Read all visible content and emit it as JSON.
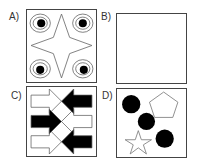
{
  "panels": [
    {
      "id": "A",
      "label": "A)",
      "content": "four concentric circle pairs with black dots in corners, central four-pointed star outline"
    },
    {
      "id": "B",
      "label": "B)",
      "content": "empty"
    },
    {
      "id": "C",
      "label": "C)",
      "content": "interleaved arrows: white right arrows and black left arrows"
    },
    {
      "id": "D",
      "label": "D)",
      "content": "three black circles on diagonal, pentagon outline, star outline"
    }
  ],
  "colors": {
    "stroke": "#555555",
    "fill_black": "#000000",
    "border": "#444444"
  }
}
